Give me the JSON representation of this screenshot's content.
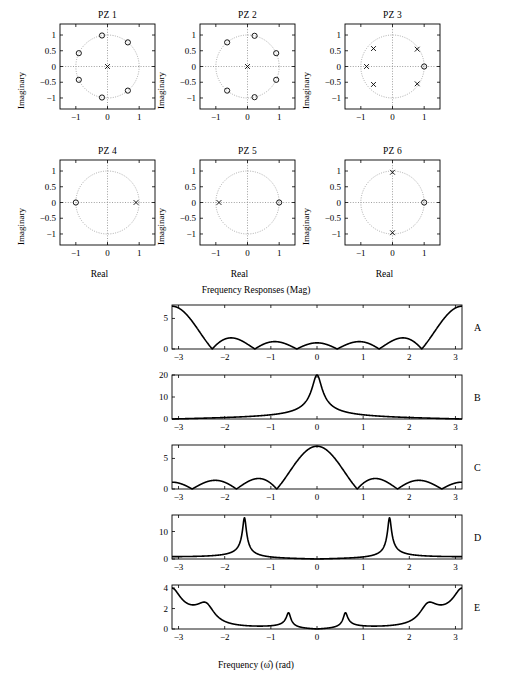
{
  "figure": {
    "pz_section_title": "Pole-Zero Plots",
    "fr_title": "Frequency Responses (Mag)",
    "fr_xlabel": "Frequency (ω̂) (rad)",
    "pz_xlabel": "Real",
    "pz_ylabel": "Imaginary",
    "pz_xticks": [
      "-1",
      "0",
      "1"
    ],
    "pz_yticks": [
      "1",
      "0.5",
      "0",
      "-0.5",
      "-1"
    ],
    "fr_xticks": [
      "-3",
      "-2",
      "-1",
      "0",
      "1",
      "2",
      "3"
    ],
    "marker_zero": "o",
    "marker_pole": "x",
    "axis_color": "#000000",
    "curve_color": "#000000",
    "grid_color": "#999999"
  },
  "chart_data": [
    {
      "type": "scatter",
      "title": "PZ 1",
      "xlabel": "Real",
      "ylabel": "Imaginary",
      "xlim": [
        -1.5,
        1.5
      ],
      "ylim": [
        -1.35,
        1.35
      ],
      "xticks": [
        -1,
        0,
        1
      ],
      "yticks": [
        -1,
        -0.5,
        0,
        0.5,
        1
      ],
      "grid": true,
      "unit_circle": true,
      "zeros": [
        [
          0.643,
          0.766
        ],
        [
          -0.174,
          0.985
        ],
        [
          -0.906,
          0.423
        ],
        [
          -0.906,
          -0.423
        ],
        [
          -0.174,
          -0.985
        ],
        [
          0.643,
          -0.766
        ]
      ],
      "poles": [
        [
          0,
          0
        ]
      ]
    },
    {
      "type": "scatter",
      "title": "PZ 2",
      "xlabel": "Real",
      "ylabel": "Imaginary",
      "xlim": [
        -1.5,
        1.5
      ],
      "ylim": [
        -1.35,
        1.35
      ],
      "xticks": [
        -1,
        0,
        1
      ],
      "yticks": [
        -1,
        -0.5,
        0,
        0.5,
        1
      ],
      "grid": true,
      "unit_circle": true,
      "zeros": [
        [
          0.906,
          0.423
        ],
        [
          0.223,
          0.975
        ],
        [
          -0.643,
          0.766
        ],
        [
          -0.643,
          -0.766
        ],
        [
          0.223,
          -0.975
        ],
        [
          0.906,
          -0.423
        ]
      ],
      "poles": [
        [
          0,
          0
        ]
      ]
    },
    {
      "type": "scatter",
      "title": "PZ 3",
      "xlabel": "Real",
      "ylabel": "Imaginary",
      "xlim": [
        -1.5,
        1.5
      ],
      "ylim": [
        -1.35,
        1.35
      ],
      "xticks": [
        -1,
        0,
        1
      ],
      "yticks": [
        -1,
        -0.5,
        0,
        0.5,
        1
      ],
      "grid": true,
      "unit_circle": true,
      "zeros": [
        [
          1.0,
          0
        ]
      ],
      "poles": [
        [
          0.78,
          0.55
        ],
        [
          -0.6,
          0.57
        ],
        [
          -0.82,
          0
        ],
        [
          -0.6,
          -0.57
        ],
        [
          0.78,
          -0.55
        ]
      ]
    },
    {
      "type": "scatter",
      "title": "PZ 4",
      "xlabel": "Real",
      "ylabel": "Imaginary",
      "xlim": [
        -1.5,
        1.5
      ],
      "ylim": [
        -1.35,
        1.35
      ],
      "xticks": [
        -1,
        0,
        1
      ],
      "yticks": [
        -1,
        -0.5,
        0,
        0.5,
        1
      ],
      "grid": true,
      "unit_circle": true,
      "zeros": [
        [
          -1.0,
          0
        ]
      ],
      "poles": [
        [
          0.9,
          0
        ]
      ]
    },
    {
      "type": "scatter",
      "title": "PZ 5",
      "xlabel": "Real",
      "ylabel": "Imaginary",
      "xlim": [
        -1.5,
        1.5
      ],
      "ylim": [
        -1.35,
        1.35
      ],
      "xticks": [
        -1,
        0,
        1
      ],
      "yticks": [
        -1,
        -0.5,
        0,
        0.5,
        1
      ],
      "grid": true,
      "unit_circle": true,
      "zeros": [
        [
          1.0,
          0
        ]
      ],
      "poles": [
        [
          -0.9,
          0
        ]
      ]
    },
    {
      "type": "scatter",
      "title": "PZ 6",
      "xlabel": "Real",
      "ylabel": "Imaginary",
      "xlim": [
        -1.5,
        1.5
      ],
      "ylim": [
        -1.35,
        1.35
      ],
      "xticks": [
        -1,
        0,
        1
      ],
      "yticks": [
        -1,
        -0.5,
        0,
        0.5,
        1
      ],
      "grid": true,
      "unit_circle": true,
      "zeros": [
        [
          1.0,
          0
        ]
      ],
      "poles": [
        [
          0,
          0.96
        ],
        [
          0,
          -0.96
        ]
      ]
    },
    {
      "type": "line",
      "label": "A",
      "title": "Frequency Responses (Mag)",
      "xlabel": "Frequency (ω̂) (rad)",
      "ylabel": "",
      "xlim": [
        -3.1416,
        3.1416
      ],
      "ylim": [
        0,
        7.2
      ],
      "xticks": [
        -3,
        -2,
        -1,
        0,
        1,
        2,
        3
      ],
      "yticks": [
        0,
        5
      ],
      "ytick_labels": [
        "0",
        "5"
      ],
      "peak_value": 7,
      "zeros_on_circle_angles": [
        0.524,
        1.571,
        2.618,
        -2.618,
        -1.571,
        -0.524
      ],
      "description": "Magnitude of 6-zero FIR; peaks 7 at ±π, nulls at ±π/6 multiples"
    },
    {
      "type": "line",
      "label": "B",
      "xlim": [
        -3.1416,
        3.1416
      ],
      "ylim": [
        0,
        20
      ],
      "xticks": [
        -3,
        -2,
        -1,
        0,
        1,
        2,
        3
      ],
      "yticks": [
        0,
        10,
        20
      ],
      "ytick_labels": [
        "0",
        "10",
        "20"
      ],
      "peak_value": 20,
      "description": "Highpass: single pole near z=+0.9 with zero at z=-1 gives max ~20 at ±π"
    },
    {
      "type": "line",
      "label": "C",
      "xlim": [
        -3.1416,
        3.1416
      ],
      "ylim": [
        0,
        7.2
      ],
      "xticks": [
        -3,
        -2,
        -1,
        0,
        1,
        2,
        3
      ],
      "yticks": [
        0,
        5
      ],
      "ytick_labels": [
        "0",
        "5"
      ],
      "peak_value": 7,
      "description": "Lowpass main lobe at ω=0 peak 7, nulls every π/3"
    },
    {
      "type": "line",
      "label": "D",
      "xlim": [
        -3.1416,
        3.1416
      ],
      "ylim": [
        0,
        16
      ],
      "xticks": [
        -3,
        -2,
        -1,
        0,
        1,
        2,
        3
      ],
      "yticks": [
        0,
        10
      ],
      "ytick_labels": [
        "0",
        "10"
      ],
      "peak_value": 15,
      "resonance_frequencies": [
        -1.571,
        1.571
      ],
      "description": "Sharp resonances at ±π/2 from conjugate poles at ±j0.96"
    },
    {
      "type": "line",
      "label": "E",
      "xlim": [
        -3.1416,
        3.1416
      ],
      "ylim": [
        0,
        4.3
      ],
      "xticks": [
        -3,
        -2,
        -1,
        0,
        1,
        2,
        3
      ],
      "yticks": [
        0,
        2,
        4
      ],
      "ytick_labels": [
        "0",
        "2",
        "4"
      ],
      "peak_value": 4,
      "resonance_frequencies": [
        -2.38,
        -0.65,
        0.65,
        2.38
      ],
      "description": "Five-pole resonator peaks: 4.0 at ±2.38, 2.6 at ±0.65"
    }
  ]
}
